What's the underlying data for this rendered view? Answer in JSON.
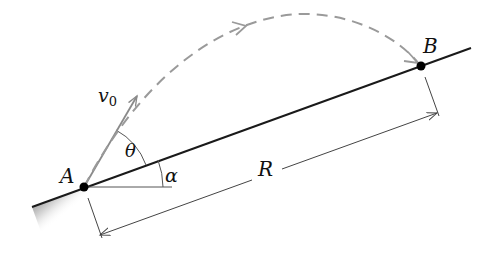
{
  "diagram": {
    "labels": {
      "point_a": "A",
      "point_b": "B",
      "velocity": "v",
      "velocity_sub": "0",
      "theta": "θ",
      "alpha": "α",
      "range": "R"
    },
    "colors": {
      "ground_line": "#1a1a1a",
      "trajectory": "#9a9a9a",
      "velocity_vector": "#8a8a8a",
      "dimension_line": "#444444",
      "point": "#000000"
    }
  }
}
